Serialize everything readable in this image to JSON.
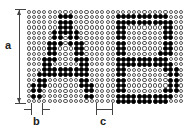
{
  "figure": {
    "labels": {
      "a": "a",
      "b": "b",
      "c": "c"
    },
    "grid": {
      "cols": 30,
      "rows": 18,
      "dot_on_color": "#000000",
      "dot_off_color": "#ffffff"
    },
    "letters": [
      "A",
      "B"
    ],
    "pattern": {
      "1": [
        6,
        7,
        8,
        17,
        18,
        19,
        20,
        21,
        22,
        23,
        24,
        25,
        26
      ],
      "2": [
        6,
        7,
        8,
        17,
        18,
        19,
        20,
        21,
        22,
        23,
        24,
        25,
        26,
        27
      ],
      "3": [
        6,
        7,
        8,
        17,
        18,
        26,
        27
      ],
      "4": [
        5,
        6,
        7,
        8,
        9,
        17,
        18,
        26,
        27
      ],
      "5": [
        5,
        6,
        8,
        9,
        17,
        18,
        26,
        27
      ],
      "6": [
        4,
        5,
        6,
        8,
        9,
        10,
        17,
        18,
        26,
        27
      ],
      "7": [
        4,
        5,
        9,
        10,
        17,
        18,
        26,
        27
      ],
      "8": [
        4,
        5,
        9,
        10,
        17,
        18,
        25,
        26,
        27
      ],
      "9": [
        3,
        4,
        5,
        9,
        10,
        11,
        17,
        18,
        19,
        20,
        21,
        22,
        23,
        24,
        25,
        26
      ],
      "10": [
        3,
        4,
        10,
        11,
        17,
        18,
        19,
        20,
        21,
        22,
        23,
        24,
        25,
        26,
        27
      ],
      "11": [
        3,
        4,
        5,
        6,
        7,
        8,
        9,
        10,
        11,
        17,
        18,
        26,
        27,
        28
      ],
      "12": [
        2,
        3,
        4,
        5,
        6,
        7,
        8,
        9,
        10,
        11,
        17,
        18,
        27,
        28
      ],
      "13": [
        2,
        3,
        10,
        11,
        17,
        18,
        27,
        28
      ],
      "14": [
        1,
        2,
        3,
        10,
        11,
        12,
        17,
        18,
        27,
        28
      ],
      "15": [
        1,
        2,
        11,
        12,
        17,
        18,
        26,
        27,
        28
      ],
      "16": [
        1,
        2,
        11,
        12,
        17,
        18,
        19,
        20,
        21,
        22,
        23,
        24,
        25,
        26,
        27
      ],
      "17": [
        17,
        18,
        19,
        20,
        21,
        22,
        23,
        24,
        25,
        26
      ]
    }
  }
}
